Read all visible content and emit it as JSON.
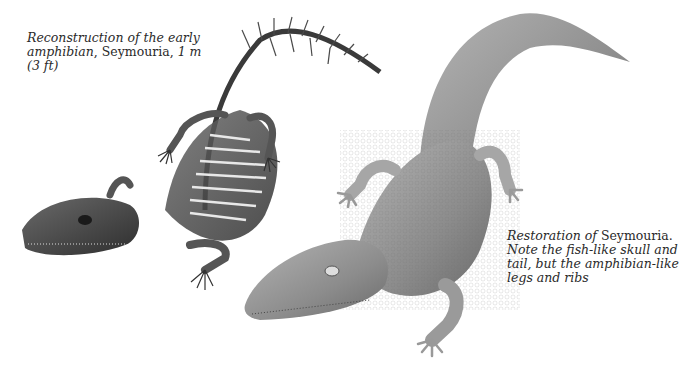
{
  "figure": {
    "left_illustration": {
      "subject": "Seymouria skeleton reconstruction",
      "caption": {
        "italic_1": "Reconstruction of the early amphibian",
        "roman_1": ", Seymouria, ",
        "italic_2": "1 m (3 ft)"
      }
    },
    "right_illustration": {
      "subject": "Seymouria life restoration",
      "caption": {
        "italic_1": "Restoration of ",
        "roman_1": "Seymouria.",
        "italic_2": " Note the fish-like skull and tail, but the amphibian-like legs and ribs"
      }
    }
  }
}
